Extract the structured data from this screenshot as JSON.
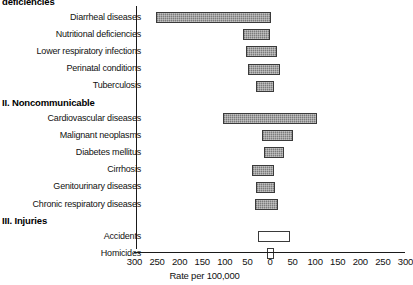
{
  "chart_data": {
    "type": "bar",
    "orientation": "horizontal-diverging",
    "title": "",
    "xlabel": "Rate per 100,000",
    "ylabel": "",
    "xlim": [
      -300,
      300
    ],
    "xticks": [
      -300,
      -250,
      -200,
      -150,
      -100,
      -50,
      0,
      50,
      100,
      150,
      200,
      250,
      300
    ],
    "xtick_labels": [
      "300",
      "250",
      "200",
      "150",
      "100",
      "50",
      "0",
      "50",
      "100",
      "150",
      "200",
      "250",
      "300"
    ],
    "grid": false,
    "legend": null,
    "note": "Bars extend left and right of a central zero axis; left side values are negative, right side positive.",
    "groups": [
      {
        "heading": "deficiencies",
        "heading_clipped": true,
        "style": "filled",
        "items": [
          {
            "label": "Diarrheal diseases",
            "left": -253,
            "right": 2
          },
          {
            "label": "Nutritional deficiencies",
            "left": -60,
            "right": 1
          },
          {
            "label": "Lower respiratory infections",
            "left": -53,
            "right": 15
          },
          {
            "label": "Perinatal conditions",
            "left": -49,
            "right": 22
          },
          {
            "label": "Tuberculosis",
            "left": -31,
            "right": 9
          }
        ]
      },
      {
        "heading": "II. Noncommunicable",
        "heading_clipped": false,
        "style": "filled",
        "items": [
          {
            "label": "Cardiovascular diseases",
            "left": -103,
            "right": 104
          },
          {
            "label": "Malignant neoplasms",
            "left": -17,
            "right": 52
          },
          {
            "label": "Diabetes mellitus",
            "left": -13,
            "right": 30
          },
          {
            "label": "Cirrhosis",
            "left": -40,
            "right": 8
          },
          {
            "label": "Genitourinary diseases",
            "left": -30,
            "right": 12
          },
          {
            "label": "Chronic respiratory diseases",
            "left": -33,
            "right": 18
          }
        ]
      },
      {
        "heading": "III. Injuries",
        "heading_clipped": false,
        "style": "hollow",
        "items": [
          {
            "label": "Accidents",
            "left": -27,
            "right": 44
          },
          {
            "label": "Homicides",
            "left": -7,
            "right": 8
          }
        ]
      }
    ]
  },
  "colors": {
    "bar_fill": "#9a9a9a",
    "bar_stroke": "#3a3a3a",
    "hollow_fill": "#ffffff",
    "axis": "#1a1a1a",
    "text": "#111111"
  }
}
